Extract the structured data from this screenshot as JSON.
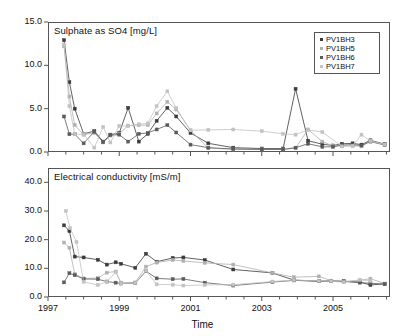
{
  "figure": {
    "xlabel": "Time",
    "x_ticks": [
      "1997",
      "1999",
      "2001",
      "2003",
      "2005"
    ],
    "legend": [
      {
        "label": "PV1BH3",
        "color": "#3a3a3a"
      },
      {
        "label": "PV1BH5",
        "color": "#b0b0b0"
      },
      {
        "label": "PV1BH6",
        "color": "#5a5a5a"
      },
      {
        "label": "PV1BH7",
        "color": "#c2c2c2"
      }
    ]
  },
  "chart_data": [
    {
      "type": "line",
      "title": "Sulphate as SO4 [mg/L]",
      "xlabel": "Time",
      "ylabel": "Sulphate as SO4 [mg/L]",
      "xlim": [
        1997.0,
        2006.6
      ],
      "ylim": [
        0.0,
        15.0
      ],
      "y_ticks": [
        0.0,
        5.0,
        10.0,
        15.0
      ],
      "y_tick_labels": [
        "0.0",
        "5.0",
        "10.0",
        "15.0"
      ],
      "x_ticks": [
        1997,
        1999,
        2001,
        2003,
        2005
      ],
      "grid": false,
      "legend_position": "top-right",
      "series": [
        {
          "name": "PV1BH3",
          "color": "#3a3a3a",
          "x": [
            1997.45,
            1997.6,
            1997.75,
            1998.0,
            1998.3,
            1998.55,
            1998.75,
            1999.0,
            1999.25,
            1999.55,
            1999.8,
            2000.05,
            2000.35,
            2000.6,
            2001.0,
            2001.5,
            2002.2,
            2003.0,
            2003.6,
            2003.95,
            2004.3,
            2004.7,
            2005.0,
            2005.25,
            2005.55,
            2005.8,
            2006.05,
            2006.45
          ],
          "y": [
            12.9,
            8.05,
            5.0,
            2.1,
            2.4,
            1.2,
            2.0,
            2.2,
            5.1,
            1.2,
            2.1,
            3.6,
            5.1,
            4.1,
            2.2,
            1.0,
            0.5,
            0.4,
            0.4,
            7.3,
            1.3,
            0.9,
            0.75,
            0.95,
            1.0,
            0.85,
            1.35,
            0.9
          ]
        },
        {
          "name": "PV1BH5",
          "color": "#b0b0b0",
          "x": [
            1997.45,
            1997.6,
            1997.75,
            1998.0,
            1998.3,
            1998.55,
            1998.75,
            1999.0,
            1999.25,
            1999.55,
            1999.8,
            2000.05,
            2000.35,
            2000.6,
            2001.0,
            2001.5,
            2002.2,
            2003.0,
            2003.6,
            2003.95,
            2004.3,
            2004.7,
            2005.0,
            2005.25,
            2005.55,
            2005.8,
            2006.05,
            2006.45
          ],
          "y": [
            12.2,
            6.4,
            3.1,
            2.0,
            2.2,
            1.1,
            1.9,
            2.1,
            3.05,
            3.1,
            3.1,
            4.45,
            5.8,
            4.9,
            2.5,
            0.45,
            0.3,
            0.3,
            0.3,
            0.45,
            2.6,
            1.2,
            0.7,
            0.7,
            0.7,
            0.65,
            1.3,
            0.85
          ]
        },
        {
          "name": "PV1BH6",
          "color": "#5a5a5a",
          "x": [
            1997.45,
            1997.6,
            1997.75,
            1998.0,
            1998.3,
            1998.55,
            1998.75,
            1999.0,
            1999.25,
            1999.55,
            1999.8,
            2000.05,
            2000.35,
            2000.6,
            2001.0,
            2001.5,
            2002.2,
            2003.0,
            2003.6,
            2003.95,
            2004.3,
            2004.7,
            2005.0,
            2005.25,
            2005.55,
            2005.8,
            2006.05,
            2006.45
          ],
          "y": [
            4.1,
            2.05,
            2.05,
            1.0,
            2.35,
            1.15,
            1.95,
            2.0,
            1.2,
            2.1,
            2.2,
            2.6,
            3.1,
            2.25,
            0.85,
            0.5,
            0.35,
            0.3,
            0.3,
            0.5,
            0.95,
            0.6,
            0.6,
            0.8,
            0.85,
            0.75,
            1.2,
            0.8
          ]
        },
        {
          "name": "PV1BH7",
          "color": "#c2c2c2",
          "x": [
            1997.45,
            1997.6,
            1997.75,
            1998.0,
            1998.3,
            1998.55,
            1998.75,
            1999.0,
            1999.25,
            1999.55,
            1999.8,
            2000.05,
            2000.35,
            2000.6,
            2001.0,
            2001.5,
            2002.2,
            2003.0,
            2003.6,
            2003.95,
            2004.3,
            2004.7,
            2005.25,
            2005.55,
            2005.8,
            2006.05,
            2006.45
          ],
          "y": [
            12.4,
            5.3,
            2.05,
            2.05,
            0.5,
            2.9,
            1.1,
            3.0,
            3.0,
            3.2,
            3.3,
            5.3,
            7.0,
            5.05,
            2.5,
            2.55,
            2.6,
            2.4,
            2.1,
            2.0,
            2.55,
            2.3,
            0.65,
            0.7,
            2.0,
            1.25,
            0.85
          ]
        }
      ]
    },
    {
      "type": "line",
      "title": "Electrical conductivity [mS/m]",
      "xlabel": "Time",
      "ylabel": "Electrical conductivity [mS/m]",
      "xlim": [
        1997.0,
        2006.6
      ],
      "ylim": [
        0.0,
        45.0
      ],
      "y_ticks": [
        0.0,
        10.0,
        20.0,
        30.0,
        40.0
      ],
      "y_tick_labels": [
        "0.0",
        "10.0",
        "20.0",
        "30.0",
        "40.0"
      ],
      "x_ticks": [
        1997,
        1999,
        2001,
        2003,
        2005
      ],
      "grid": false,
      "legend_position": "none",
      "series": [
        {
          "name": "PV1BH3",
          "color": "#3a3a3a",
          "x": [
            1997.45,
            1997.6,
            1997.75,
            1998.0,
            1998.4,
            1998.65,
            1998.9,
            1999.05,
            1999.45,
            1999.75,
            2000.05,
            2000.5,
            2000.8,
            2001.4,
            2002.2,
            2003.3,
            2003.9,
            2004.6,
            2004.95,
            2005.3,
            2005.75,
            2006.05,
            2006.45
          ],
          "y": [
            25.0,
            23.0,
            14.1,
            13.8,
            13.0,
            11.3,
            12.1,
            11.6,
            10.2,
            15.1,
            12.3,
            13.6,
            13.8,
            12.9,
            9.6,
            8.4,
            5.9,
            5.5,
            5.6,
            5.5,
            5.2,
            4.2,
            4.6
          ]
        },
        {
          "name": "PV1BH5",
          "color": "#b0b0b0",
          "x": [
            1997.45,
            1997.6,
            1997.75,
            1998.0,
            1998.4,
            1998.65,
            1998.9,
            1999.05,
            1999.45,
            1999.75,
            2000.05,
            2000.5,
            2000.8,
            2001.4,
            2002.2,
            2003.3,
            2003.9,
            2004.6,
            2004.95,
            2005.3,
            2005.75,
            2006.05,
            2006.45
          ],
          "y": [
            19.0,
            17.2,
            8.0,
            6.5,
            6.6,
            8.5,
            8.9,
            5.0,
            5.1,
            10.6,
            12.0,
            12.9,
            12.6,
            11.9,
            11.3,
            8.4,
            6.9,
            7.2,
            5.7,
            5.4,
            5.8,
            6.4,
            4.7
          ]
        },
        {
          "name": "PV1BH6",
          "color": "#5a5a5a",
          "x": [
            1997.45,
            1997.6,
            1997.75,
            1998.0,
            1998.4,
            1998.65,
            1998.9,
            1999.05,
            1999.45,
            1999.75,
            2000.05,
            2000.5,
            2000.8,
            2001.4,
            2002.2,
            2003.3,
            2003.9,
            2004.6,
            2004.95,
            2005.3,
            2005.75,
            2006.05,
            2006.45
          ],
          "y": [
            5.1,
            8.3,
            7.6,
            6.3,
            6.2,
            5.4,
            5.0,
            4.7,
            4.8,
            9.0,
            6.5,
            6.2,
            6.3,
            5.0,
            4.0,
            5.2,
            5.8,
            5.5,
            5.5,
            5.4,
            5.0,
            4.8,
            4.5
          ]
        },
        {
          "name": "PV1BH7",
          "color": "#c2c2c2",
          "x": [
            1997.5,
            1997.62,
            1997.8,
            1998.0,
            1998.4,
            1998.65,
            1998.9,
            1999.05,
            1999.45,
            1999.75,
            2000.05,
            2000.5,
            2000.8,
            2001.4,
            2002.2,
            2003.3,
            2003.9,
            2004.6,
            2004.95,
            2005.3,
            2005.75,
            2006.05
          ],
          "y": [
            30.0,
            24.0,
            19.2,
            5.3,
            4.2,
            5.3,
            8.7,
            4.7,
            4.9,
            9.2,
            4.4,
            4.3,
            4.0,
            4.2,
            4.3,
            5.4,
            5.9,
            5.6,
            5.5,
            5.2,
            6.0,
            5.6
          ]
        }
      ]
    }
  ]
}
